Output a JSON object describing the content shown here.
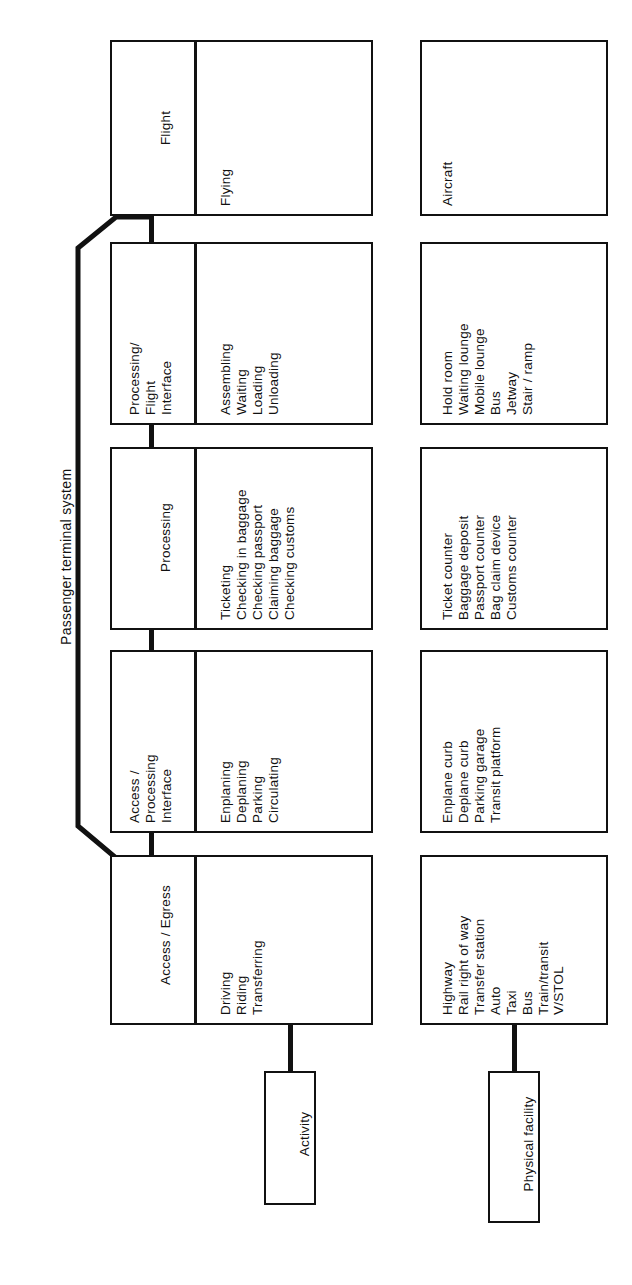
{
  "diagram": {
    "title": "Passenger terminal system",
    "orientation": "rotated-90-ccw",
    "row_labels": {
      "activity": "Activity",
      "facility": "Physical facility"
    },
    "stages": [
      {
        "id": "access-egress",
        "name": "Access / Egress",
        "activities": "Driving\nRiding\nTransferring",
        "facilities": "Highway\nRail right of way\nTransfer station\nAuto\nTaxi\nBus\nTrain/transit\nV/STOL",
        "in_system": false
      },
      {
        "id": "access-processing-interface",
        "name": "Access /\nProcessing\nInterface",
        "activities": "Enplaning\nDeplaning\nParking\nCirculating",
        "facilities": "Enplane curb\nDeplane curb\nParking garage\nTransit platform",
        "in_system": true
      },
      {
        "id": "processing",
        "name": "Processing",
        "activities": "Ticketing\nChecking in baggage\nChecking passport\nClaiming baggage\nChecking customs",
        "facilities": "Ticket counter\nBaggage deposit\nPassport counter\nBag claim device\nCustoms counter",
        "in_system": true
      },
      {
        "id": "processing-flight-interface",
        "name": "Processing/\nFlight\nInterface",
        "activities": "Assembling\nWaiting\nLoading\nUnloading",
        "facilities": "Hold room\nWaiting lounge\nMobile lounge\nBus\nJetway\nStair / ramp",
        "in_system": true
      },
      {
        "id": "flight",
        "name": "Flight",
        "activities": "Flying",
        "facilities": "Aircraft",
        "in_system": false
      }
    ],
    "colors": {
      "stroke": "#111111",
      "background": "#ffffff"
    }
  }
}
